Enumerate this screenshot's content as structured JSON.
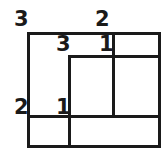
{
  "figure": {
    "type": "rectangle-dissection-diagram",
    "line_color": "#1a1a1a",
    "background_color": "#ffffff",
    "labels": {
      "outer_top_left": "3",
      "outer_top": "2",
      "outer_left": "2",
      "inner_top": "3",
      "inner_right": "1",
      "inner_bottom": "1"
    }
  }
}
